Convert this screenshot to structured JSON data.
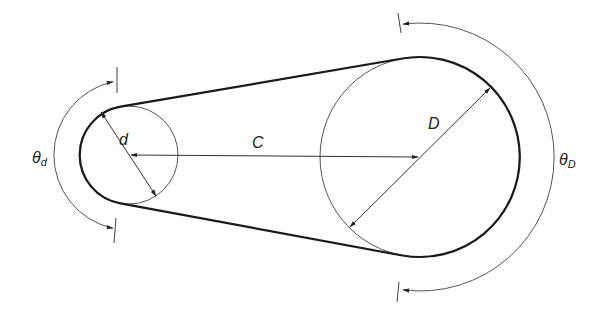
{
  "diagram": {
    "labels": {
      "small_diameter": "d",
      "large_diameter": "D",
      "center_distance": "C",
      "theta_small": "θ",
      "theta_small_sub": "d",
      "theta_large": "θ",
      "theta_large_sub": "D"
    },
    "small_pulley": {
      "cx": 129,
      "cy": 155,
      "r": 49
    },
    "large_pulley": {
      "cx": 420,
      "cy": 157,
      "r": 100
    },
    "wrap_arc_small": {
      "r": 75
    },
    "wrap_arc_large": {
      "r": 134
    },
    "colors": {
      "belt": "#1a1a1a",
      "thin_line": "#555555",
      "text": "#222222",
      "background": "#ffffff"
    }
  }
}
